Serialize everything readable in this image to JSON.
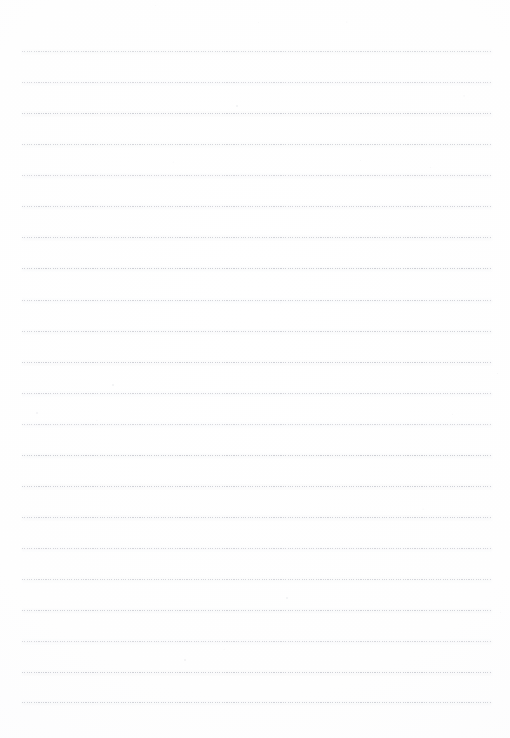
{
  "document": {
    "kind": "scanned-lined-paper",
    "title": "Lined Paper",
    "page_label": "",
    "body_text": "",
    "background_color": "#ffffff",
    "rule_color": "#96 98a4",
    "rule_color_hex": "#9698a4",
    "paper_tint_hex": "#fdfdfe"
  },
  "layout": {
    "page_width": 510,
    "page_height": 738,
    "rule_left": 22,
    "rule_right": 492,
    "rule_width": 470,
    "first_rule_y": 51,
    "rule_spacing": 30.9,
    "rule_count": 22,
    "top_margin": 51,
    "bottom_margin": 36
  },
  "rules": [
    {
      "index": 1,
      "y": 51,
      "left": 22,
      "width": 470,
      "opacity": 0.55
    },
    {
      "index": 2,
      "y": 82,
      "left": 22,
      "width": 470,
      "opacity": 0.58
    },
    {
      "index": 3,
      "y": 113,
      "left": 22,
      "width": 470,
      "opacity": 0.7
    },
    {
      "index": 4,
      "y": 144,
      "left": 22,
      "width": 470,
      "opacity": 0.62
    },
    {
      "index": 5,
      "y": 175,
      "left": 22,
      "width": 470,
      "opacity": 0.6
    },
    {
      "index": 6,
      "y": 206,
      "left": 22,
      "width": 470,
      "opacity": 0.66
    },
    {
      "index": 7,
      "y": 237,
      "left": 22,
      "width": 470,
      "opacity": 0.68
    },
    {
      "index": 8,
      "y": 268,
      "left": 22,
      "width": 470,
      "opacity": 0.72
    },
    {
      "index": 9,
      "y": 300,
      "left": 22,
      "width": 470,
      "opacity": 0.64
    },
    {
      "index": 10,
      "y": 331,
      "left": 22,
      "width": 470,
      "opacity": 0.66
    },
    {
      "index": 11,
      "y": 362,
      "left": 22,
      "width": 470,
      "opacity": 0.7
    },
    {
      "index": 12,
      "y": 393,
      "left": 22,
      "width": 470,
      "opacity": 0.64
    },
    {
      "index": 13,
      "y": 424,
      "left": 22,
      "width": 470,
      "opacity": 0.58
    },
    {
      "index": 14,
      "y": 455,
      "left": 22,
      "width": 470,
      "opacity": 0.72
    },
    {
      "index": 15,
      "y": 486,
      "left": 22,
      "width": 470,
      "opacity": 0.7
    },
    {
      "index": 16,
      "y": 517,
      "left": 22,
      "width": 470,
      "opacity": 0.68
    },
    {
      "index": 17,
      "y": 548,
      "left": 22,
      "width": 470,
      "opacity": 0.64
    },
    {
      "index": 18,
      "y": 579,
      "left": 22,
      "width": 470,
      "opacity": 0.62
    },
    {
      "index": 19,
      "y": 610,
      "left": 22,
      "width": 470,
      "opacity": 0.66
    },
    {
      "index": 20,
      "y": 641,
      "left": 22,
      "width": 470,
      "opacity": 0.58
    },
    {
      "index": 21,
      "y": 672,
      "left": 22,
      "width": 470,
      "opacity": 0.7
    },
    {
      "index": 22,
      "y": 702,
      "left": 22,
      "width": 470,
      "opacity": 0.66
    }
  ],
  "specks": [
    {
      "x": 236,
      "y": 105,
      "size": 1.6,
      "opacity": 0.35
    },
    {
      "x": 430,
      "y": 167,
      "size": 1.4,
      "opacity": 0.3
    },
    {
      "x": 360,
      "y": 160,
      "size": 1.3,
      "opacity": 0.26
    },
    {
      "x": 112,
      "y": 384,
      "size": 1.5,
      "opacity": 0.32
    },
    {
      "x": 497,
      "y": 373,
      "size": 1.4,
      "opacity": 0.28
    },
    {
      "x": 36,
      "y": 412,
      "size": 1.5,
      "opacity": 0.33
    },
    {
      "x": 452,
      "y": 414,
      "size": 1.3,
      "opacity": 0.26
    },
    {
      "x": 286,
      "y": 597,
      "size": 1.5,
      "opacity": 0.32
    },
    {
      "x": 184,
      "y": 659,
      "size": 1.6,
      "opacity": 0.34
    },
    {
      "x": 500,
      "y": 612,
      "size": 1.3,
      "opacity": 0.25
    },
    {
      "x": 258,
      "y": 22,
      "size": 1.2,
      "opacity": 0.2
    },
    {
      "x": 155,
      "y": 5,
      "size": 1.2,
      "opacity": 0.18
    }
  ]
}
